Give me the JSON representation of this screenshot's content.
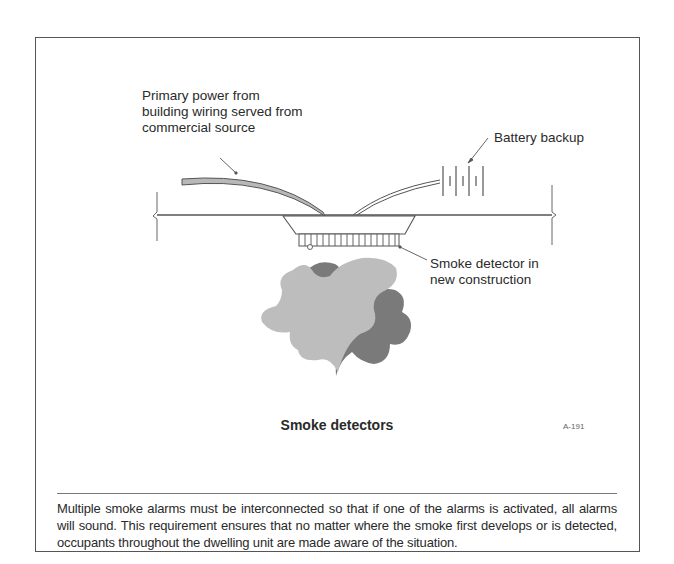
{
  "figure": {
    "caption": "Smoke detectors",
    "figure_code": "A-191",
    "labels": {
      "primary_power": [
        "Primary power from",
        "building wiring served from",
        "commercial source"
      ],
      "battery_backup": "Battery backup",
      "smoke_detector": [
        "Smoke detector in",
        "new construction"
      ]
    },
    "colors": {
      "frame": "#555555",
      "line": "#555555",
      "wire_fill": "#b8b8b8",
      "smoke_light": "#bdbdbd",
      "smoke_dark": "#7a7a7a",
      "text": "#2a2a2a"
    }
  },
  "description": {
    "text": "Multiple smoke alarms must be interconnected so that if one of the alarms is activated, all alarms will sound. This requirement ensures that no matter where the smoke first develops or is detected, occupants throughout the dwelling unit are made aware of the situation."
  }
}
